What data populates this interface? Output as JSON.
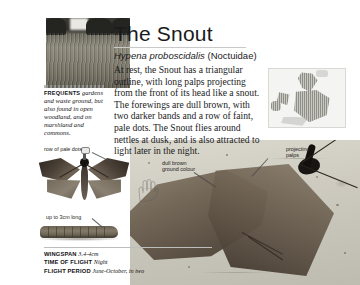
{
  "page": {
    "title": "The Snout",
    "scientific_name": "Hypena proboscidalis",
    "family": "(Noctuidae)",
    "body_text": "At rest, the Snout has a triangular outline, with long palps projecting from the front of its head like a snout. The forewings are dull brown, with two darker bands and a row of faint, pale dots. The Snout flies around nettles at dusk, and is also attracted to light later in the night.",
    "background_color": "#ffffff",
    "text_color": "#1b1b1b"
  },
  "habitat_caption": {
    "label": "FREQUENTS",
    "text": "gardens and waste ground, but also found in open woodland, and on marshland and commons."
  },
  "callouts": {
    "row_of_pale_dots": "row of pale dots",
    "caterpillar_size": "up to 3cm long",
    "ground_colour_line1": "dull brown",
    "ground_colour_line2": "ground colour",
    "palps_line1": "projecting",
    "palps_line2": "palps"
  },
  "facts": [
    {
      "key": "WINGSPAN",
      "value": "3.4-4cm"
    },
    {
      "key": "TIME OF FLIGHT",
      "value": "Night"
    },
    {
      "key": "FLIGHT PERIOD",
      "value": "June-October, in two"
    }
  ],
  "images": {
    "habitat_photo": "habitat-meadow-photo",
    "specimen_photo": "moth-specimen-photo",
    "caterpillar_illustration": "caterpillar-illustration",
    "main_photo": "moth-at-rest-photo",
    "distribution_map": "europe-distribution-map",
    "hand_sketch": "hand-scale-sketch"
  }
}
